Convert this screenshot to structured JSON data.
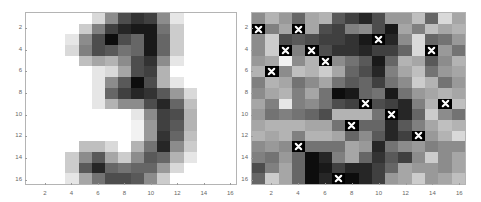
{
  "chart_data": [
    {
      "type": "heatmap",
      "title": "",
      "description": "16x16 grayscale image of handwritten digit 3 (0 = white, 1 = black)",
      "xlabel": "",
      "ylabel": "",
      "xlim": [
        0.5,
        16.5
      ],
      "ylim": [
        0.5,
        16.5
      ],
      "xticks": [
        "2",
        "4",
        "6",
        "8",
        "10",
        "12",
        "14",
        "16"
      ],
      "yticks": [
        "2",
        "4",
        "6",
        "8",
        "10",
        "12",
        "14",
        "16"
      ],
      "colormap": "gray_reversed",
      "values": [
        [
          0,
          0,
          0,
          0,
          0,
          0.15,
          0.45,
          0.7,
          0.8,
          0.75,
          0.45,
          0.1,
          0,
          0,
          0,
          0
        ],
        [
          0,
          0,
          0,
          0,
          0.2,
          0.5,
          0.75,
          0.85,
          0.9,
          0.9,
          0.55,
          0.2,
          0,
          0,
          0,
          0
        ],
        [
          0,
          0,
          0,
          0.1,
          0.45,
          0.7,
          0.95,
          0.7,
          0.6,
          0.9,
          0.6,
          0.2,
          0,
          0,
          0,
          0
        ],
        [
          0,
          0,
          0,
          0.15,
          0.5,
          0.7,
          0.65,
          0.55,
          0.6,
          0.9,
          0.6,
          0.2,
          0,
          0,
          0,
          0
        ],
        [
          0,
          0,
          0,
          0,
          0.25,
          0.35,
          0.3,
          0.45,
          0.7,
          0.8,
          0.45,
          0.1,
          0,
          0,
          0,
          0
        ],
        [
          0,
          0,
          0,
          0,
          0,
          0.1,
          0.15,
          0.35,
          0.7,
          0.75,
          0.3,
          0,
          0,
          0,
          0,
          0
        ],
        [
          0,
          0,
          0,
          0,
          0,
          0.1,
          0.45,
          0.65,
          0.95,
          0.7,
          0.3,
          0.1,
          0,
          0,
          0,
          0
        ],
        [
          0,
          0,
          0,
          0,
          0,
          0.1,
          0.6,
          0.75,
          0.85,
          0.8,
          0.65,
          0.4,
          0.15,
          0,
          0,
          0
        ],
        [
          0,
          0,
          0,
          0,
          0,
          0.1,
          0.3,
          0.45,
          0.45,
          0.7,
          0.85,
          0.6,
          0.25,
          0,
          0,
          0
        ],
        [
          0,
          0,
          0,
          0,
          0,
          0,
          0,
          0,
          0.1,
          0.45,
          0.75,
          0.7,
          0.3,
          0,
          0,
          0
        ],
        [
          0,
          0,
          0,
          0,
          0,
          0,
          0,
          0,
          0.05,
          0.4,
          0.75,
          0.65,
          0.3,
          0,
          0,
          0
        ],
        [
          0,
          0,
          0,
          0,
          0,
          0,
          0,
          0,
          0.05,
          0.4,
          0.8,
          0.6,
          0.25,
          0,
          0,
          0
        ],
        [
          0,
          0,
          0,
          0,
          0.25,
          0.25,
          0.15,
          0,
          0.3,
          0.55,
          0.85,
          0.45,
          0.2,
          0,
          0,
          0
        ],
        [
          0,
          0,
          0,
          0.2,
          0.45,
          0.65,
          0.35,
          0.2,
          0.45,
          0.65,
          0.6,
          0.3,
          0.1,
          0,
          0,
          0
        ],
        [
          0,
          0,
          0,
          0.2,
          0.65,
          0.85,
          0.6,
          0.55,
          0.6,
          0.6,
          0.4,
          0.15,
          0,
          0,
          0,
          0
        ],
        [
          0,
          0,
          0,
          0.1,
          0.35,
          0.55,
          0.7,
          0.7,
          0.65,
          0.45,
          0.2,
          0,
          0,
          0,
          0,
          0
        ]
      ]
    },
    {
      "type": "heatmap",
      "title": "",
      "description": "16x16 grayscale noisy image with white-x markers on selected pixels",
      "xlabel": "",
      "ylabel": "",
      "xlim": [
        0.5,
        16.5
      ],
      "ylim": [
        0.5,
        16.5
      ],
      "xticks": [
        "2",
        "4",
        "6",
        "8",
        "10",
        "12",
        "14",
        "16"
      ],
      "yticks": [
        "2",
        "4",
        "6",
        "8",
        "10",
        "12",
        "14",
        "16"
      ],
      "colormap": "gray_reversed",
      "values": [
        [
          0.45,
          0.3,
          0.4,
          0.6,
          0.35,
          0.3,
          0.65,
          0.75,
          0.85,
          0.7,
          0.4,
          0.4,
          0.25,
          0.6,
          0.15,
          0.35
        ],
        [
          1,
          0.5,
          0.35,
          1,
          0.35,
          0.7,
          0.75,
          0.5,
          0.45,
          0.7,
          0.9,
          0.35,
          0.5,
          0.25,
          0.35,
          0.3
        ],
        [
          0.45,
          0.2,
          0.7,
          0.65,
          0.7,
          0.75,
          0.75,
          0.8,
          0.9,
          1,
          0.85,
          0.45,
          0.15,
          0.6,
          0.55,
          0.4
        ],
        [
          0.45,
          0.2,
          1,
          0.5,
          1,
          0.7,
          0.8,
          0.8,
          0.85,
          0.75,
          0.75,
          0.6,
          0.15,
          1,
          0.4,
          0.55
        ],
        [
          0.4,
          0.35,
          0.05,
          0.45,
          0.3,
          1,
          0.45,
          0.55,
          0.65,
          0.9,
          0.6,
          0.3,
          0.35,
          0.65,
          0.45,
          0.3
        ],
        [
          0.3,
          1,
          0.45,
          0.25,
          0.3,
          0.2,
          0.35,
          0.6,
          0.7,
          0.85,
          0.5,
          0.35,
          0.25,
          0.55,
          0.4,
          0.35
        ],
        [
          0.5,
          0.3,
          0.35,
          0.55,
          0.45,
          0.35,
          0.55,
          0.65,
          0.6,
          0.75,
          0.55,
          0.45,
          0.2,
          0.3,
          0.55,
          0.4
        ],
        [
          0.45,
          0.35,
          0.3,
          0.5,
          0.35,
          0.55,
          0.95,
          0.9,
          0.6,
          0.55,
          0.9,
          0.55,
          0.4,
          0.35,
          0.3,
          0.35
        ],
        [
          0.35,
          0.5,
          0.1,
          0.5,
          0.45,
          0.55,
          0.7,
          0.75,
          1,
          0.7,
          0.75,
          0.85,
          0.5,
          0.3,
          1,
          0.25
        ],
        [
          0.4,
          0.55,
          0.5,
          0.55,
          0.6,
          0.7,
          0.3,
          0.3,
          0.3,
          0.55,
          1,
          0.85,
          0.6,
          0.2,
          0.45,
          0.55
        ],
        [
          0.35,
          0.3,
          0.3,
          0.3,
          0.35,
          0.35,
          0.55,
          1,
          0.6,
          0.6,
          0.85,
          0.65,
          0.5,
          0.35,
          0.25,
          0.3
        ],
        [
          0.3,
          0.35,
          0.3,
          0.5,
          0.3,
          0.3,
          0.35,
          0.6,
          0.45,
          0.65,
          0.85,
          0.75,
          1,
          0.4,
          0.3,
          0.15
        ],
        [
          0.45,
          0.4,
          0.45,
          1,
          0.55,
          0.55,
          0.55,
          0.35,
          0.4,
          0.85,
          0.55,
          0.45,
          0.4,
          0.5,
          0.45,
          0.45
        ],
        [
          0.5,
          0.55,
          0.4,
          0.6,
          0.95,
          0.85,
          0.5,
          0.35,
          0.6,
          0.8,
          0.65,
          0.75,
          0.45,
          0.2,
          0.45,
          0.35
        ],
        [
          0.7,
          0.5,
          0.35,
          0.6,
          0.95,
          0.9,
          0.75,
          0.85,
          0.85,
          0.75,
          0.6,
          0.35,
          0.4,
          0.4,
          0.45,
          0.35
        ],
        [
          0.6,
          0.2,
          0.35,
          0.6,
          0.95,
          0.85,
          1,
          0.95,
          0.85,
          0.75,
          0.4,
          0.35,
          0.2,
          0.4,
          0.35,
          0.25
        ]
      ],
      "markers": {
        "symbol": "x",
        "color": "#ffffff",
        "background": "#000000",
        "points_col_row": [
          [
            1,
            2
          ],
          [
            4,
            2
          ],
          [
            10,
            3
          ],
          [
            3,
            4
          ],
          [
            5,
            4
          ],
          [
            14,
            4
          ],
          [
            6,
            5
          ],
          [
            2,
            6
          ],
          [
            9,
            9
          ],
          [
            15,
            9
          ],
          [
            11,
            10
          ],
          [
            8,
            11
          ],
          [
            13,
            12
          ],
          [
            4,
            13
          ],
          [
            7,
            16
          ]
        ]
      }
    }
  ],
  "panels": [
    {
      "left": 25,
      "top": 12,
      "width": 212,
      "height": 173
    },
    {
      "left": 251,
      "top": 12,
      "width": 215,
      "height": 173
    }
  ]
}
